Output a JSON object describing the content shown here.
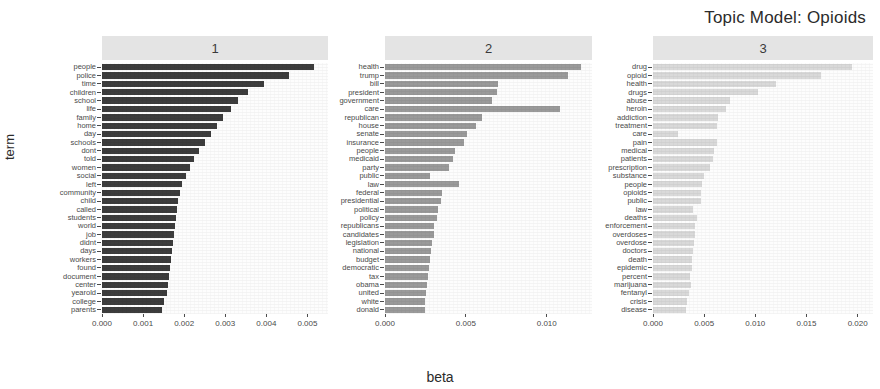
{
  "chart_data": {
    "type": "bar",
    "title": "Topic Model: Opioids",
    "xlabel": "beta",
    "ylabel": "term",
    "orientation": "horizontal",
    "grid": false,
    "legend": "none",
    "facets": [
      {
        "label": "1",
        "xlim": [
          0,
          0.0055
        ],
        "xticks": [
          0.0,
          0.001,
          0.002,
          0.003,
          0.004,
          0.005
        ],
        "xticklabels": [
          "0.000",
          "0.001",
          "0.002",
          "0.003",
          "0.004",
          "0.005"
        ],
        "bar_color": "#3d3d3d",
        "categories": [
          "people",
          "police",
          "time",
          "children",
          "school",
          "life",
          "family",
          "home",
          "day",
          "schools",
          "dont",
          "told",
          "women",
          "social",
          "left",
          "community",
          "child",
          "called",
          "students",
          "world",
          "job",
          "didnt",
          "days",
          "workers",
          "found",
          "document",
          "center",
          "yearold",
          "college",
          "parents"
        ],
        "values": [
          0.00515,
          0.00455,
          0.00395,
          0.00355,
          0.0033,
          0.00315,
          0.00295,
          0.0028,
          0.00265,
          0.0025,
          0.00235,
          0.00225,
          0.00215,
          0.00205,
          0.00195,
          0.0019,
          0.00185,
          0.00182,
          0.0018,
          0.00178,
          0.00176,
          0.00173,
          0.0017,
          0.00167,
          0.00165,
          0.00163,
          0.0016,
          0.00158,
          0.00152,
          0.00147
        ]
      },
      {
        "label": "2",
        "xlim": [
          0,
          0.0128
        ],
        "xticks": [
          0.0,
          0.005,
          0.01
        ],
        "xticklabels": [
          "0.000",
          "0.005",
          "0.010"
        ],
        "bar_color": "#9a9a9a",
        "categories": [
          "health",
          "trump",
          "bill",
          "president",
          "government",
          "care",
          "republican",
          "house",
          "senate",
          "insurance",
          "people",
          "medicaid",
          "party",
          "public",
          "law",
          "federal",
          "presidential",
          "political",
          "policy",
          "republicans",
          "candidates",
          "legislation",
          "national",
          "budget",
          "democratic",
          "tax",
          "obama",
          "united",
          "white",
          "donald"
        ],
        "values": [
          0.01215,
          0.0113,
          0.007,
          0.0069,
          0.0066,
          0.01085,
          0.006,
          0.0056,
          0.0051,
          0.0049,
          0.0043,
          0.0042,
          0.00395,
          0.0028,
          0.0046,
          0.00355,
          0.00345,
          0.00325,
          0.0032,
          0.00305,
          0.003,
          0.0029,
          0.00285,
          0.0028,
          0.00275,
          0.00265,
          0.0026,
          0.00255,
          0.0025,
          0.00245
        ]
      },
      {
        "label": "3",
        "xlim": [
          0,
          0.0215
        ],
        "xticks": [
          0.0,
          0.005,
          0.01,
          0.015,
          0.02
        ],
        "xticklabels": [
          "0.000",
          "0.005",
          "0.010",
          "0.015",
          "0.020"
        ],
        "bar_color": "#d9d9d9",
        "categories": [
          "drug",
          "opioid",
          "health",
          "drugs",
          "abuse",
          "heroin",
          "addiction",
          "treatment",
          "care",
          "pain",
          "medical",
          "patients",
          "prescription",
          "substance",
          "people",
          "opioids",
          "public",
          "law",
          "deaths",
          "enforcement",
          "overdoses",
          "overdose",
          "doctors",
          "death",
          "epidemic",
          "percent",
          "marijuana",
          "fentanyl",
          "crisis",
          "disease"
        ],
        "values": [
          0.01945,
          0.0164,
          0.012,
          0.0103,
          0.0075,
          0.0071,
          0.0064,
          0.0063,
          0.00245,
          0.00625,
          0.006,
          0.0059,
          0.00555,
          0.005,
          0.0048,
          0.0047,
          0.00465,
          0.00395,
          0.0043,
          0.00415,
          0.0041,
          0.004,
          0.0039,
          0.00385,
          0.0038,
          0.0036,
          0.0037,
          0.00355,
          0.0033,
          0.0032
        ]
      }
    ]
  }
}
